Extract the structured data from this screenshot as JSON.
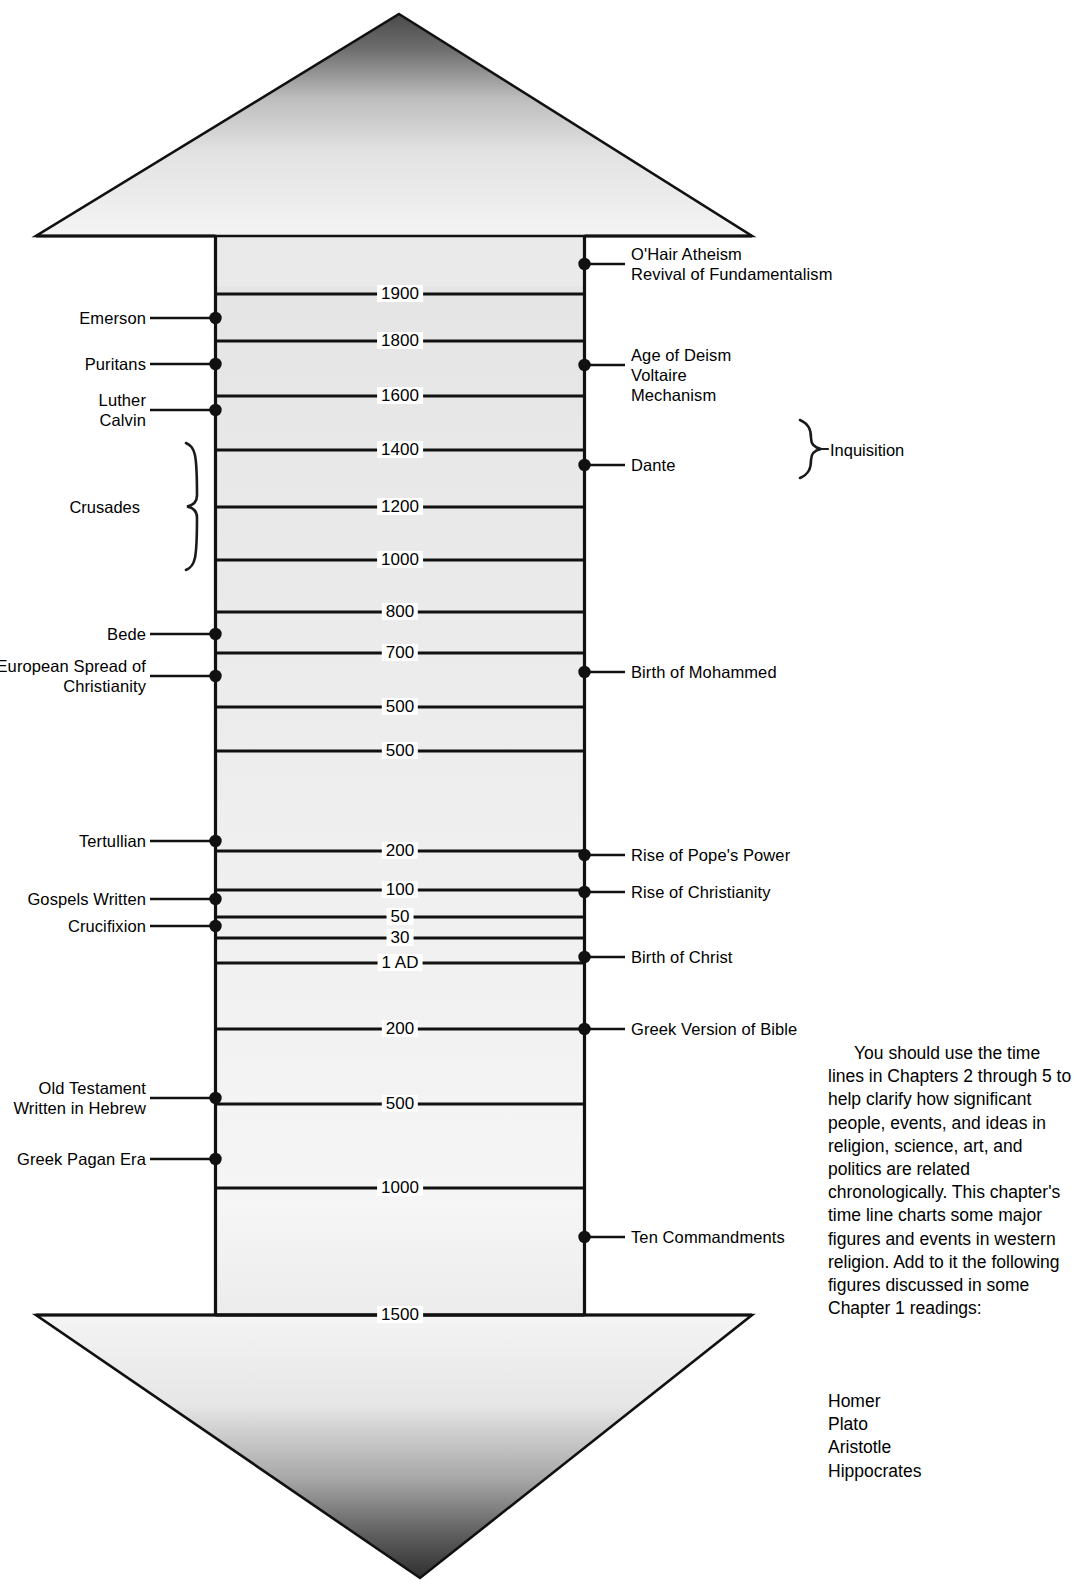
{
  "figure": {
    "arrow_color": "#000000",
    "fill_light": "#f2f2f2",
    "fill_dark": "#3b3b3b"
  },
  "years": [
    {
      "label": "1900",
      "y": 294
    },
    {
      "label": "1800",
      "y": 341
    },
    {
      "label": "1600",
      "y": 396
    },
    {
      "label": "1400",
      "y": 450
    },
    {
      "label": "1200",
      "y": 507
    },
    {
      "label": "1000",
      "y": 560
    },
    {
      "label": "800",
      "y": 612
    },
    {
      "label": "700",
      "y": 653
    },
    {
      "label": "500",
      "y": 707
    },
    {
      "label": "500",
      "y": 751
    },
    {
      "label": "200",
      "y": 851
    },
    {
      "label": "100",
      "y": 890
    },
    {
      "label": "50",
      "y": 917
    },
    {
      "label": "30",
      "y": 938
    },
    {
      "label": "1 AD",
      "y": 963
    },
    {
      "label": "200",
      "y": 1029
    },
    {
      "label": "500",
      "y": 1104
    },
    {
      "label": "1000",
      "y": 1188
    },
    {
      "label": "1500",
      "y": 1315
    }
  ],
  "left_events": [
    {
      "label": "Emerson",
      "y": 318,
      "lines": 1
    },
    {
      "label": "Puritans",
      "y": 364,
      "lines": 1
    },
    {
      "label": "Luther\nCalvin",
      "y": 410,
      "lines": 2
    },
    {
      "label": "Bede",
      "y": 634,
      "lines": 1
    },
    {
      "label": "European Spread of\nChristianity",
      "y": 676,
      "lines": 2
    },
    {
      "label": "Tertullian",
      "y": 841,
      "lines": 1
    },
    {
      "label": "Gospels Written",
      "y": 899,
      "lines": 1
    },
    {
      "label": "Crucifixion",
      "y": 926,
      "lines": 1
    },
    {
      "label": "Old Testament\nWritten in Hebrew",
      "y": 1098,
      "lines": 2
    },
    {
      "label": "Greek Pagan Era",
      "y": 1159,
      "lines": 1
    }
  ],
  "right_events": [
    {
      "label": "O'Hair Atheism\nRevival of Fundamentalism",
      "y": 264,
      "lines": 2
    },
    {
      "label": "Age of Deism\nVoltaire\nMechanism",
      "y": 365,
      "lines": 3
    },
    {
      "label": "Dante",
      "y": 465,
      "lines": 1
    },
    {
      "label": "Birth of Mohammed",
      "y": 672,
      "lines": 1
    },
    {
      "label": "Rise of Pope's Power",
      "y": 855,
      "lines": 1
    },
    {
      "label": "Rise of Christianity",
      "y": 892,
      "lines": 1
    },
    {
      "label": "Birth of Christ",
      "y": 957,
      "lines": 1
    },
    {
      "label": "Greek Version of Bible",
      "y": 1029,
      "lines": 1
    },
    {
      "label": "Ten Commandments",
      "y": 1237,
      "lines": 1
    }
  ],
  "braces": [
    {
      "name": "crusades",
      "label": "Crusades",
      "side": "left",
      "top": 443,
      "bottom": 570,
      "x": 186,
      "label_x": 98,
      "label_y": 497
    },
    {
      "name": "inquisition",
      "label": "Inquisition",
      "side": "right",
      "top": 420,
      "bottom": 478,
      "x": 800,
      "label_x": 818,
      "label_y": 440
    }
  ],
  "side_note": {
    "paragraph": "You should use the time lines in Chapters 2 through 5 to help clarify how significant people, events, and ideas in religion, science, art, and politics are related chronologically. This chapter's time line charts some major figures and events in western religion. Add to it the following figures discussed in some Chapter 1 readings:",
    "names": [
      "Homer",
      "Plato",
      "Aristotle",
      "Hippocrates"
    ]
  },
  "chart_data": {
    "type": "table",
    "axis_orientation": "vertical, most recent at top, arrow points up (future) and down (past)",
    "axis_tick_labels": [
      "1900",
      "1800",
      "1600",
      "1400",
      "1200",
      "1000",
      "800",
      "700",
      "500",
      "500",
      "200",
      "100",
      "50",
      "30",
      "1 AD",
      "200",
      "500",
      "1000",
      "1500"
    ],
    "ylabel": "",
    "xlabel": "",
    "grid": true,
    "legend": "none",
    "series": [
      {
        "name": "Left column events (people / movements)",
        "values": [
          {
            "label": "Emerson",
            "approx_year": "1850 AD"
          },
          {
            "label": "Puritans",
            "approx_year": "1700 AD"
          },
          {
            "label": "Luther / Calvin",
            "approx_year": "1520 AD"
          },
          {
            "label": "Crusades",
            "approx_year": "1095-1290 AD"
          },
          {
            "label": "Bede",
            "approx_year": "730 AD"
          },
          {
            "label": "European Spread of Christianity",
            "approx_year": "600 AD"
          },
          {
            "label": "Tertullian",
            "approx_year": "200 AD"
          },
          {
            "label": "Gospels Written",
            "approx_year": "75 AD"
          },
          {
            "label": "Crucifixion",
            "approx_year": "30 AD"
          },
          {
            "label": "Old Testament Written in Hebrew",
            "approx_year": "500 BC"
          },
          {
            "label": "Greek Pagan Era",
            "approx_year": "800 BC"
          }
        ]
      },
      {
        "name": "Right column events (ideas / milestones)",
        "values": [
          {
            "label": "O'Hair Atheism / Revival of Fundamentalism",
            "approx_year": "1960 AD"
          },
          {
            "label": "Age of Deism / Voltaire / Mechanism",
            "approx_year": "1700 AD"
          },
          {
            "label": "Inquisition",
            "approx_year": "1480-1600 AD"
          },
          {
            "label": "Dante",
            "approx_year": "1300 AD"
          },
          {
            "label": "Birth of Mohammed",
            "approx_year": "570 AD"
          },
          {
            "label": "Rise of Pope's Power",
            "approx_year": "150 AD"
          },
          {
            "label": "Rise of Christianity",
            "approx_year": "60 AD"
          },
          {
            "label": "Birth of Christ",
            "approx_year": "1 AD"
          },
          {
            "label": "Greek Version of Bible",
            "approx_year": "200 BC"
          },
          {
            "label": "Ten Commandments",
            "approx_year": "1250 BC"
          }
        ]
      }
    ]
  }
}
